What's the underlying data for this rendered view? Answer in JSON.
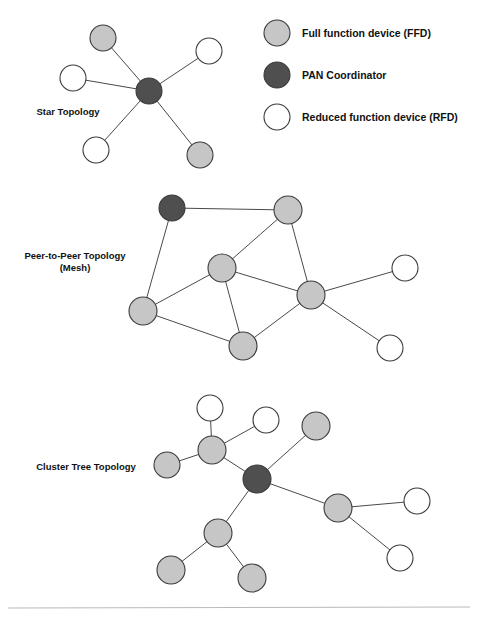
{
  "figure": {
    "background_color": "#ffffff",
    "width": 478,
    "height": 622
  },
  "colors": {
    "ffd_fill": "#c6c6c6",
    "pan_fill": "#4f4f4f",
    "rfd_fill": "#ffffff",
    "node_stroke": "#3b3b3b",
    "edge_stroke": "#4a4a4a",
    "text": "#111111",
    "divider": "#b9b9b9"
  },
  "legend": {
    "items": [
      {
        "type": "ffd",
        "label": "Full function device (FFD)",
        "cx": 277,
        "cy": 33,
        "r": 13
      },
      {
        "type": "pan",
        "label": "PAN Coordinator",
        "cx": 277,
        "cy": 75,
        "r": 13
      },
      {
        "type": "rfd",
        "label": "Reduced function device (RFD)",
        "cx": 277,
        "cy": 117,
        "r": 13
      }
    ],
    "label_x": 302
  },
  "divider": {
    "x1": 8,
    "y1": 608,
    "x2": 470,
    "y2": 607
  },
  "topologies": [
    {
      "id": "star",
      "label_lines": [
        "Star Topology"
      ],
      "label_x": 68,
      "label_y": 115,
      "nodes": [
        {
          "id": "s_hub",
          "type": "pan",
          "cx": 149,
          "cy": 91,
          "r": 13
        },
        {
          "id": "s_n1",
          "type": "ffd",
          "cx": 103,
          "cy": 38,
          "r": 13
        },
        {
          "id": "s_n2",
          "type": "rfd",
          "cx": 209,
          "cy": 51,
          "r": 13
        },
        {
          "id": "s_n3",
          "type": "rfd",
          "cx": 73,
          "cy": 78,
          "r": 13
        },
        {
          "id": "s_n4",
          "type": "rfd",
          "cx": 96,
          "cy": 150,
          "r": 13
        },
        {
          "id": "s_n5",
          "type": "ffd",
          "cx": 200,
          "cy": 155,
          "r": 13
        }
      ],
      "edges": [
        [
          "s_hub",
          "s_n1"
        ],
        [
          "s_hub",
          "s_n2"
        ],
        [
          "s_hub",
          "s_n3"
        ],
        [
          "s_hub",
          "s_n4"
        ],
        [
          "s_hub",
          "s_n5"
        ]
      ]
    },
    {
      "id": "mesh",
      "label_lines": [
        "Peer-to-Peer Topology",
        "(Mesh)"
      ],
      "label_x": 75,
      "label_y": 259,
      "nodes": [
        {
          "id": "m_pan",
          "type": "pan",
          "cx": 172,
          "cy": 208,
          "r": 13
        },
        {
          "id": "m_a",
          "type": "ffd",
          "cx": 288,
          "cy": 210,
          "r": 14
        },
        {
          "id": "m_b",
          "type": "ffd",
          "cx": 222,
          "cy": 268,
          "r": 14
        },
        {
          "id": "m_c",
          "type": "ffd",
          "cx": 143,
          "cy": 311,
          "r": 14
        },
        {
          "id": "m_d",
          "type": "ffd",
          "cx": 311,
          "cy": 295,
          "r": 14
        },
        {
          "id": "m_e",
          "type": "ffd",
          "cx": 243,
          "cy": 346,
          "r": 14
        },
        {
          "id": "m_r1",
          "type": "rfd",
          "cx": 405,
          "cy": 268,
          "r": 13
        },
        {
          "id": "m_r2",
          "type": "rfd",
          "cx": 390,
          "cy": 348,
          "r": 13
        }
      ],
      "edges": [
        [
          "m_pan",
          "m_a"
        ],
        [
          "m_pan",
          "m_c"
        ],
        [
          "m_a",
          "m_b"
        ],
        [
          "m_a",
          "m_d"
        ],
        [
          "m_b",
          "m_c"
        ],
        [
          "m_b",
          "m_d"
        ],
        [
          "m_b",
          "m_e"
        ],
        [
          "m_c",
          "m_e"
        ],
        [
          "m_e",
          "m_d"
        ],
        [
          "m_d",
          "m_r1"
        ],
        [
          "m_d",
          "m_r2"
        ]
      ]
    },
    {
      "id": "cluster-tree",
      "label_lines": [
        "Cluster Tree Topology"
      ],
      "label_x": 86,
      "label_y": 470,
      "nodes": [
        {
          "id": "c_pan",
          "type": "pan",
          "cx": 257,
          "cy": 479,
          "r": 14
        },
        {
          "id": "c_f1",
          "type": "ffd",
          "cx": 212,
          "cy": 450,
          "r": 14
        },
        {
          "id": "c_r1",
          "type": "rfd",
          "cx": 210,
          "cy": 408,
          "r": 13
        },
        {
          "id": "c_r2",
          "type": "rfd",
          "cx": 266,
          "cy": 420,
          "r": 13
        },
        {
          "id": "c_f2",
          "type": "ffd",
          "cx": 167,
          "cy": 465,
          "r": 13
        },
        {
          "id": "c_f3",
          "type": "ffd",
          "cx": 316,
          "cy": 426,
          "r": 14
        },
        {
          "id": "c_f4",
          "type": "ffd",
          "cx": 338,
          "cy": 508,
          "r": 14
        },
        {
          "id": "c_r3",
          "type": "rfd",
          "cx": 417,
          "cy": 501,
          "r": 13
        },
        {
          "id": "c_r4",
          "type": "rfd",
          "cx": 400,
          "cy": 558,
          "r": 13
        },
        {
          "id": "c_f5",
          "type": "ffd",
          "cx": 218,
          "cy": 533,
          "r": 14
        },
        {
          "id": "c_f6",
          "type": "ffd",
          "cx": 171,
          "cy": 570,
          "r": 14
        },
        {
          "id": "c_f7",
          "type": "ffd",
          "cx": 252,
          "cy": 578,
          "r": 14
        }
      ],
      "edges": [
        [
          "c_pan",
          "c_f1"
        ],
        [
          "c_pan",
          "c_f3"
        ],
        [
          "c_pan",
          "c_f4"
        ],
        [
          "c_pan",
          "c_f5"
        ],
        [
          "c_f1",
          "c_r1"
        ],
        [
          "c_f1",
          "c_r2"
        ],
        [
          "c_f1",
          "c_f2"
        ],
        [
          "c_f4",
          "c_r3"
        ],
        [
          "c_f4",
          "c_r4"
        ],
        [
          "c_f5",
          "c_f6"
        ],
        [
          "c_f5",
          "c_f7"
        ]
      ]
    }
  ]
}
